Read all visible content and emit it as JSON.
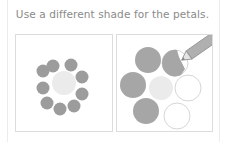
{
  "instruction": "Use a different shade for the petals.",
  "colors": {
    "petal_filled": "#a9a9a9",
    "petal_dark": "#9a9a9a",
    "center": "#ebebeb",
    "outline": "#d6d6d6",
    "caption": "#8a8a8a"
  },
  "panels": [
    {
      "name": "example-flower",
      "petal_count": 9,
      "state": "all petals shaded"
    },
    {
      "name": "exercise-flower",
      "petal_count": 6,
      "filled_petals": 3,
      "partial_petals": 1,
      "empty_petals": 2,
      "tool": "pencil"
    }
  ]
}
